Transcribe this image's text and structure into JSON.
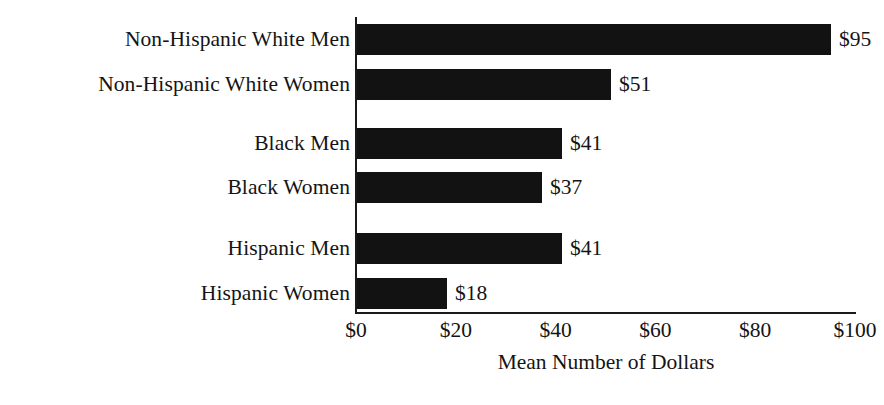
{
  "chart_data": {
    "type": "bar",
    "orientation": "horizontal",
    "title": "",
    "xlabel": "Mean Number of Dollars",
    "ylabel": "",
    "categories": [
      "Non-Hispanic White Men",
      "Non-Hispanic White Women",
      "Black Men",
      "Black Women",
      "Hispanic Men",
      "Hispanic Women"
    ],
    "values": [
      95,
      51,
      41,
      37,
      41,
      18
    ],
    "value_labels": [
      "$95",
      "$51",
      "$41",
      "$37",
      "$41",
      "$18"
    ],
    "xlim": [
      0,
      100
    ],
    "xticks": [
      0,
      20,
      40,
      60,
      80,
      100
    ],
    "xtick_labels": [
      "$0",
      "$20",
      "$40",
      "$60",
      "$80",
      "$100"
    ],
    "grid": false,
    "legend": false,
    "bar_color": "#121212",
    "background_color": "#ffffff",
    "group_gaps_after": [
      1,
      3
    ]
  },
  "bars": [
    {
      "label": "Non-Hispanic White Men",
      "value": 95,
      "value_label": "$95",
      "top": 23
    },
    {
      "label": "Non-Hispanic White Women",
      "value": 51,
      "value_label": "$51",
      "top": 68
    },
    {
      "label": "Black Men",
      "value": 41,
      "value_label": "$41",
      "top": 127
    },
    {
      "label": "Black Women",
      "value": 37,
      "value_label": "$37",
      "top": 171
    },
    {
      "label": "Hispanic Men",
      "value": 41,
      "value_label": "$41",
      "top": 232
    },
    {
      "label": "Hispanic Women",
      "value": 18,
      "value_label": "$18",
      "top": 277
    }
  ],
  "ticks": [
    {
      "label": "$0",
      "value": 0
    },
    {
      "label": "$20",
      "value": 20
    },
    {
      "label": "$40",
      "value": 40
    },
    {
      "label": "$60",
      "value": 60
    },
    {
      "label": "$80",
      "value": 80
    },
    {
      "label": "$100",
      "value": 100
    }
  ],
  "axis": {
    "title": "Mean Number of Dollars",
    "origin_x_px": 356,
    "max_x_px": 855,
    "color": "#1a1a1a"
  }
}
